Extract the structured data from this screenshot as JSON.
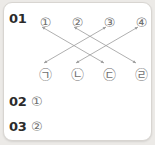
{
  "card": {
    "background": "#ffffff",
    "border_color": "#d8d5d1"
  },
  "questions": [
    {
      "number": "01",
      "answer": ""
    },
    {
      "number": "02",
      "answer": "①"
    },
    {
      "number": "03",
      "answer": "②"
    }
  ],
  "matching": {
    "top_row": [
      {
        "label": "①",
        "x": 34,
        "y": 12
      },
      {
        "label": "②",
        "x": 66,
        "y": 12
      },
      {
        "label": "③",
        "x": 98,
        "y": 12
      },
      {
        "label": "④",
        "x": 130,
        "y": 12
      }
    ],
    "bottom_row": [
      {
        "label": "㉠",
        "x": 34,
        "y": 64
      },
      {
        "label": "㉡",
        "x": 66,
        "y": 64
      },
      {
        "label": "㉢",
        "x": 98,
        "y": 64
      },
      {
        "label": "㉣",
        "x": 130,
        "y": 64
      }
    ],
    "line_color": "#9a9a9a",
    "connections": [
      {
        "from": "①",
        "to": "㉢",
        "x1": 38,
        "y1": 24,
        "x2": 100,
        "y2": 60
      },
      {
        "from": "②",
        "to": "㉣",
        "x1": 70,
        "y1": 24,
        "x2": 132,
        "y2": 60
      },
      {
        "from": "③",
        "to": "㉠",
        "x1": 102,
        "y1": 24,
        "x2": 40,
        "y2": 60
      },
      {
        "from": "④",
        "to": "㉡",
        "x1": 134,
        "y1": 24,
        "x2": 72,
        "y2": 60
      }
    ]
  }
}
